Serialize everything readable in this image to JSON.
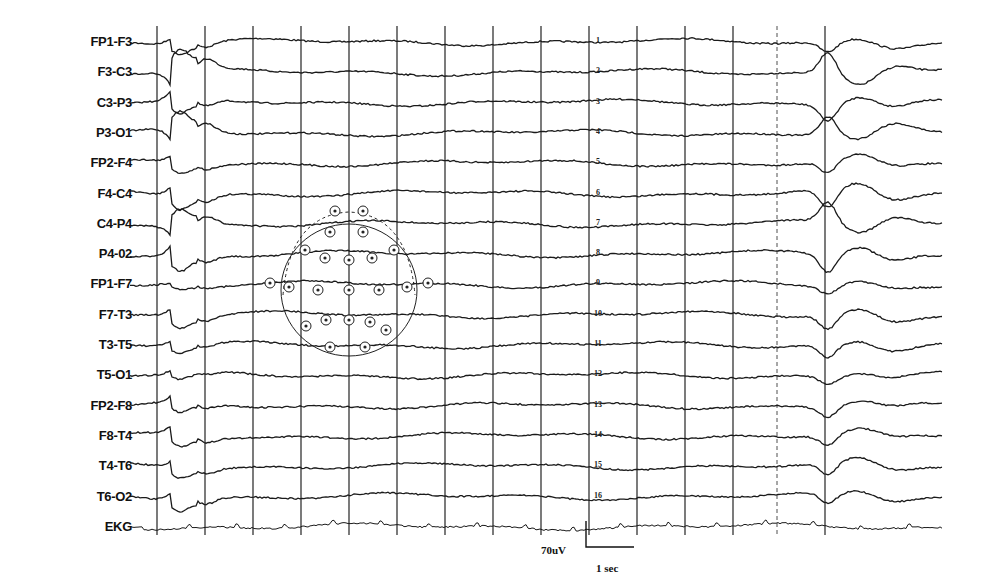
{
  "figure": {
    "type": "eeg-recording",
    "montage": "bipolar longitudinal",
    "scale": {
      "amplitude_label": "70uV",
      "time_label": "1 sec"
    },
    "colors": {
      "trace": "#1a1a1a",
      "grid": "#222222",
      "background": "#ffffff"
    }
  },
  "channels": [
    {
      "label": "FP1-F3",
      "num": "1"
    },
    {
      "label": "F3-C3",
      "num": "2"
    },
    {
      "label": "C3-P3",
      "num": "3"
    },
    {
      "label": "P3-O1",
      "num": "4"
    },
    {
      "label": "FP2-F4",
      "num": "5"
    },
    {
      "label": "F4-C4",
      "num": "6"
    },
    {
      "label": "C4-P4",
      "num": "7"
    },
    {
      "label": "P4-02",
      "num": "8"
    },
    {
      "label": "FP1-F7",
      "num": "9"
    },
    {
      "label": "F7-T3",
      "num": "10"
    },
    {
      "label": "T3-T5",
      "num": "11"
    },
    {
      "label": "T5-O1",
      "num": "12"
    },
    {
      "label": "FP2-F8",
      "num": "13"
    },
    {
      "label": "F8-T4",
      "num": "14"
    },
    {
      "label": "T4-T6",
      "num": "15"
    },
    {
      "label": "T6-O2",
      "num": "16"
    },
    {
      "label": "EKG",
      "num": ""
    }
  ],
  "chart_data": {
    "type": "line",
    "title": "",
    "xlabel": "time (1 sec per grid division)",
    "ylabel": "",
    "series": [
      {
        "name": "FP1-F3"
      },
      {
        "name": "F3-C3"
      },
      {
        "name": "C3-P3"
      },
      {
        "name": "P3-O1"
      },
      {
        "name": "FP2-F4"
      },
      {
        "name": "F4-C4"
      },
      {
        "name": "C4-P4"
      },
      {
        "name": "P4-02"
      },
      {
        "name": "FP1-F7"
      },
      {
        "name": "F7-T3"
      },
      {
        "name": "T3-T5"
      },
      {
        "name": "T5-O1"
      },
      {
        "name": "FP2-F8"
      },
      {
        "name": "F8-T4"
      },
      {
        "name": "T4-T6"
      },
      {
        "name": "T6-O2"
      },
      {
        "name": "EKG"
      }
    ],
    "grid": "vertical lines at 1-second intervals",
    "annotations": [
      "Generalized discharge at ~1 s (left)",
      "Generalized discharge at ~13.5 s (right)",
      "Scale bar: 70uV vertical, 1 sec horizontal",
      "Inset: 10-20 electrode placement head diagram"
    ],
    "x_range_sec": [
      0,
      17
    ],
    "channel_count": 17
  }
}
